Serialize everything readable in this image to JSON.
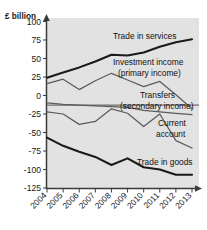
{
  "chart_data": {
    "type": "line",
    "title": "",
    "ylabel": "£ billion",
    "xlabel": "",
    "grid": false,
    "legend_position": "inline-annotations",
    "x": [
      2004,
      2005,
      2006,
      2007,
      2008,
      2009,
      2010,
      2011,
      2012,
      2013
    ],
    "categories": [
      "2004",
      "2005",
      "2006",
      "2007",
      "2008",
      "2009",
      "2010",
      "2011",
      "2012",
      "2013"
    ],
    "ylim": [
      -125,
      100
    ],
    "yticks": [
      100,
      75,
      50,
      25,
      0,
      -25,
      -50,
      -75,
      -100,
      -125
    ],
    "ytick_labels": [
      "100",
      "75",
      "50",
      "25",
      "0",
      "-25",
      "-50",
      "-75",
      "-100",
      "-125"
    ],
    "series": [
      {
        "name": "Trade in services",
        "values": [
          24,
          31,
          38,
          46,
          55,
          54,
          58,
          66,
          72,
          76
        ],
        "emphasis": "thick"
      },
      {
        "name": "Investment income (primary income)",
        "values": [
          16,
          22,
          8,
          20,
          30,
          21,
          12,
          19,
          1,
          -18
        ],
        "emphasis": "thin"
      },
      {
        "name": "Transfers (secondary income)",
        "values": [
          -10,
          -12,
          -13,
          -14,
          -15,
          -16,
          -20,
          -22,
          -24,
          -26
        ],
        "emphasis": "thin"
      },
      {
        "name": "Current account",
        "values": [
          -22,
          -25,
          -39,
          -35,
          -18,
          -24,
          -42,
          -25,
          -61,
          -71
        ],
        "emphasis": "thin"
      },
      {
        "name": "Trade in goods",
        "values": [
          -57,
          -68,
          -76,
          -83,
          -94,
          -85,
          -97,
          -100,
          -107,
          -107
        ],
        "emphasis": "thick"
      }
    ],
    "annotations": [
      {
        "text": "Trade in services",
        "x_px": 113,
        "y_px": 39
      },
      {
        "text": "Investment income",
        "x_px": 113,
        "y_px": 65
      },
      {
        "text": "(primary income)",
        "x_px": 118,
        "y_px": 76
      },
      {
        "text": "Transfers",
        "x_px": 140,
        "y_px": 98
      },
      {
        "text": "(secondary income)",
        "x_px": 120,
        "y_px": 109
      },
      {
        "text": "Current",
        "x_px": 158,
        "y_px": 126
      },
      {
        "text": "account",
        "x_px": 156,
        "y_px": 137
      },
      {
        "text": "Trade in goods",
        "x_px": 137,
        "y_px": 165
      }
    ],
    "colors": {
      "plot_background": "#e2e2e2",
      "page_background": "#ffffff",
      "thick_line": "#1a1a1a",
      "thin_line": "#5b5b5b",
      "axis": "#3a3a3a",
      "zero_line": "#6e6e6e",
      "text": "#111111"
    }
  }
}
